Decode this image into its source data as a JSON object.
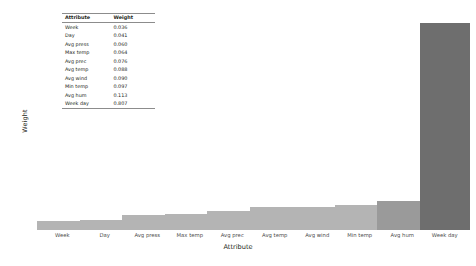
{
  "chart_data": {
    "type": "bar",
    "title": "",
    "xlabel": "Attribute",
    "ylabel": "Weight",
    "categories": [
      "Week",
      "Day",
      "Avg press",
      "Max temp",
      "Avg prec",
      "Avg temp",
      "Avg wind",
      "Min temp",
      "Avg hum",
      "Week day"
    ],
    "values": [
      0.036,
      0.041,
      0.06,
      0.064,
      0.076,
      0.088,
      0.09,
      0.097,
      0.113,
      0.807
    ],
    "ylim": [
      0.0,
      0.85
    ],
    "grid": false,
    "legend": "none",
    "bar_color": "#b4b4b4",
    "bar_color_highlight": "#6e6e6e",
    "ytick_labels": [
      "0.85",
      "0.84",
      "0.82",
      "0.80",
      "0.79",
      "0.77",
      "0.76",
      "0.74",
      "0.72",
      "0.71",
      "0.69",
      "0.68",
      "0.66",
      "0.64",
      "0.63",
      "0.61",
      "0.60",
      "0.58",
      "0.56",
      "0.55",
      "0.53",
      "0.52",
      "0.50",
      "0.48",
      "0.47",
      "0.45",
      "0.44",
      "0.42",
      "0.40",
      "0.39",
      "0.37",
      "0.36",
      "0.34",
      "0.32",
      "0.31",
      "0.29",
      "0.28",
      "0.26",
      "0.24",
      "0.23",
      "0.21",
      "0.20",
      "0.18",
      "0.16",
      "0.15",
      "0.13",
      "0.12",
      "0.10",
      "0.08",
      "0.07",
      "0.05",
      "0.04",
      "0.02",
      "0.00"
    ]
  },
  "inset_table": {
    "headers": [
      "Attribute",
      "Weight"
    ],
    "rows": [
      {
        "attribute": "Week",
        "weight": "0.036"
      },
      {
        "attribute": "Day",
        "weight": "0.041"
      },
      {
        "attribute": "Avg press",
        "weight": "0.060"
      },
      {
        "attribute": "Max temp",
        "weight": "0.064"
      },
      {
        "attribute": "Avg prec",
        "weight": "0.076"
      },
      {
        "attribute": "Avg temp",
        "weight": "0.088"
      },
      {
        "attribute": "Avg wind",
        "weight": "0.090"
      },
      {
        "attribute": "Min temp",
        "weight": "0.097"
      },
      {
        "attribute": "Avg hum",
        "weight": "0.113"
      },
      {
        "attribute": "Week day",
        "weight": "0.807"
      }
    ]
  }
}
